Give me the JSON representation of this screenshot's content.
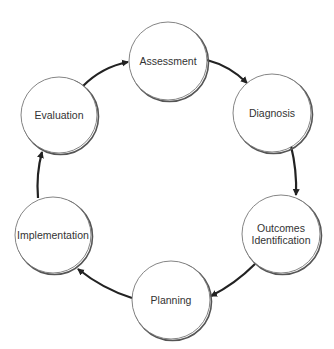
{
  "diagram": {
    "type": "cycle",
    "direction": "clockwise",
    "nodes": [
      {
        "id": "assessment",
        "lines": [
          "Assessment"
        ],
        "cx": 168,
        "cy": 61,
        "r": 39
      },
      {
        "id": "diagnosis",
        "lines": [
          "Diagnosis"
        ],
        "cx": 272,
        "cy": 113,
        "r": 39
      },
      {
        "id": "outcomes-identification",
        "lines": [
          "Outcomes",
          "Identification"
        ],
        "cx": 281,
        "cy": 234,
        "r": 39
      },
      {
        "id": "planning",
        "lines": [
          "Planning"
        ],
        "cx": 171,
        "cy": 300,
        "r": 39
      },
      {
        "id": "implementation",
        "lines": [
          "Implementation"
        ],
        "cx": 53,
        "cy": 235,
        "r": 38
      },
      {
        "id": "evaluation",
        "lines": [
          "Evaluation"
        ],
        "cx": 59,
        "cy": 115,
        "r": 38
      }
    ],
    "edges": [
      {
        "from": "assessment",
        "to": "diagnosis",
        "path": "M207,60 Q230,66 247,83"
      },
      {
        "from": "diagnosis",
        "to": "outcomes-identification",
        "path": "M291,146 Q297,170 296,195"
      },
      {
        "from": "outcomes-identification",
        "to": "planning",
        "path": "M255,264 Q235,284 211,296"
      },
      {
        "from": "planning",
        "to": "implementation",
        "path": "M132,298 Q103,289 78,269"
      },
      {
        "from": "implementation",
        "to": "evaluation",
        "path": "M38,198 Q36,174 42,152"
      },
      {
        "from": "evaluation",
        "to": "assessment",
        "path": "M83,86 Q102,67 128,62"
      }
    ],
    "colors": {
      "node_fill": "#ffffff",
      "node_stroke": "#777777",
      "node_shadow": "#555555",
      "edge": "#222222",
      "text": "#333333"
    }
  }
}
